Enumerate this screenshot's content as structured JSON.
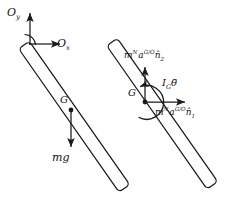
{
  "figure": {
    "stroke_color": "#1a1a1a",
    "text_color": "#111111",
    "background": "#ffffff"
  },
  "left_diagram": {
    "name": "free-body-diagram",
    "axis_y_label": "O",
    "axis_y_sub": "y",
    "axis_x_label": "O",
    "axis_x_sub": "x",
    "center_of_mass_label": "G",
    "weight_label": "mg",
    "pivot_marker": "right-angle",
    "rod": {
      "pivot_x": 24,
      "pivot_y": 45,
      "end_x": 124,
      "end_y": 188,
      "thickness": 13
    },
    "weight_arrow": {
      "from_x": 71,
      "from_y": 112,
      "to_x": 71,
      "to_y": 148
    },
    "axis_arrows": {
      "y_from_x": 30,
      "y_from_y": 44,
      "y_to_x": 30,
      "y_to_y": 12,
      "x_from_x": 29,
      "x_from_y": 44,
      "x_to_x": 61,
      "x_to_y": 44
    }
  },
  "right_diagram": {
    "name": "kinetic-diagram",
    "center_of_mass_label": "G",
    "force_n2": {
      "mass": "m",
      "frame": "N",
      "accel": "a",
      "accel_sup": "G/O",
      "direction": "n",
      "direction_sub": "2"
    },
    "force_n1": {
      "mass": "m",
      "frame": "N",
      "accel": "a",
      "accel_sup": "G/O",
      "direction": "n",
      "direction_sub": "1"
    },
    "moment": {
      "inertia": "I",
      "inertia_sub": "G",
      "angular_accel": "θ"
    },
    "rod": {
      "pivot_x": 112,
      "pivot_y": 42,
      "end_x": 212,
      "end_y": 185,
      "thickness": 13
    },
    "force_arrow_n2": {
      "from_x": 145,
      "from_y": 102,
      "to_x": 145,
      "to_y": 66
    },
    "force_arrow_n1": {
      "from_x": 145,
      "from_y": 102,
      "to_x": 186,
      "to_y": 102
    },
    "moment_arc": {
      "center_x": 145,
      "center_y": 102,
      "radius": 17
    }
  }
}
